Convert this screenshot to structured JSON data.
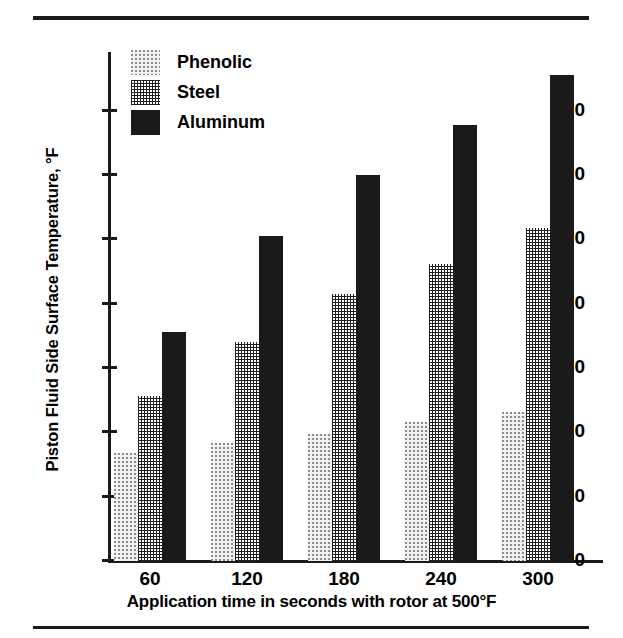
{
  "figure": {
    "top_rule": "horizontal-rule",
    "bottom_rule": "horizontal-rule"
  },
  "chart_data": {
    "type": "bar",
    "title": "",
    "subtitle": "",
    "xlabel": "Application time in seconds with rotor at 500°F",
    "ylabel": "Piston Fluid Side Surface Temperature, °F",
    "categories": [
      "60",
      "120",
      "180",
      "240",
      "300"
    ],
    "series": [
      {
        "name": "Phenolic",
        "values": [
          84,
          92,
          99,
          108,
          116
        ],
        "pattern": "light-dotted",
        "color": "#f2f2f2"
      },
      {
        "name": "Steel",
        "values": [
          128,
          170,
          208,
          231,
          259
        ],
        "pattern": "cross-hatch",
        "color": "#6e6e6e"
      },
      {
        "name": "Aluminum",
        "values": [
          178,
          253,
          300,
          339,
          378
        ],
        "pattern": "solid",
        "color": "#1a1a1a"
      }
    ],
    "ylim": [
      0,
      395
    ],
    "yticks": [
      0,
      50,
      100,
      150,
      200,
      250,
      300,
      350
    ],
    "ytick_labels": [
      "0",
      "50",
      "100",
      "150",
      "200",
      "250",
      "300",
      "350"
    ],
    "grid": false,
    "legend_position": "top-left",
    "bar_group_count": 5,
    "bars_per_group": 3
  },
  "legend": {
    "items": [
      {
        "label": "Phenolic",
        "swatch": "phenolic-swatch"
      },
      {
        "label": "Steel",
        "swatch": "steel-swatch"
      },
      {
        "label": "Aluminum",
        "swatch": "aluminum-swatch"
      }
    ]
  }
}
